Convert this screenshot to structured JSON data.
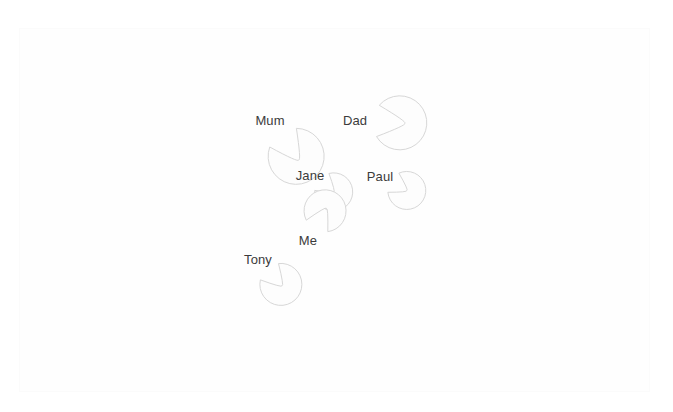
{
  "canvas": {
    "width": 673,
    "height": 412,
    "background_color": "#ffffff",
    "frame": {
      "x": 19,
      "y": 28,
      "width": 631,
      "height": 364,
      "border_color": "#fbfbfb",
      "fill_color": "#fefefe"
    }
  },
  "style": {
    "stroke_color": "#d7d7d7",
    "fill_color": "#fdfdfd",
    "stroke_width": 1,
    "label_color": "#3b3b3b",
    "label_font_size": 13
  },
  "diagram": {
    "type": "bubble-map",
    "node_count": 6,
    "nodes": [
      {
        "id": "mum",
        "label": "Mum",
        "cx": 270,
        "cy": 119,
        "r": 28,
        "tail_direction": "down-right",
        "tail_angle_deg": 55,
        "tail_length": 22,
        "label_x": 270,
        "label_y": 120
      },
      {
        "id": "dad",
        "label": "Dad",
        "cx": 356,
        "cy": 119,
        "r": 27,
        "tail_direction": "right",
        "tail_angle_deg": 5,
        "tail_length": 22,
        "label_x": 355,
        "label_y": 120
      },
      {
        "id": "jane",
        "label": "Jane",
        "cx": 310,
        "cy": 172,
        "r": 19,
        "tail_direction": "down-right",
        "tail_angle_deg": 40,
        "tail_length": 12,
        "label_x": 310,
        "label_y": 175
      },
      {
        "id": "paul",
        "label": "Paul",
        "cx": 380,
        "cy": 175,
        "r": 19,
        "tail_direction": "down-right",
        "tail_angle_deg": 30,
        "tail_length": 12,
        "label_x": 380,
        "label_y": 176
      },
      {
        "id": "me",
        "label": "Me",
        "cx": 309,
        "cy": 241,
        "r": 21,
        "tail_direction": "up-right",
        "tail_angle_deg": -62,
        "tail_length": 16,
        "label_x": 308,
        "label_y": 240
      },
      {
        "id": "tony",
        "label": "Tony",
        "cx": 258,
        "cy": 259,
        "r": 21,
        "tail_direction": "down-right",
        "tail_angle_deg": 48,
        "tail_length": 15,
        "label_x": 258,
        "label_y": 259
      }
    ]
  }
}
